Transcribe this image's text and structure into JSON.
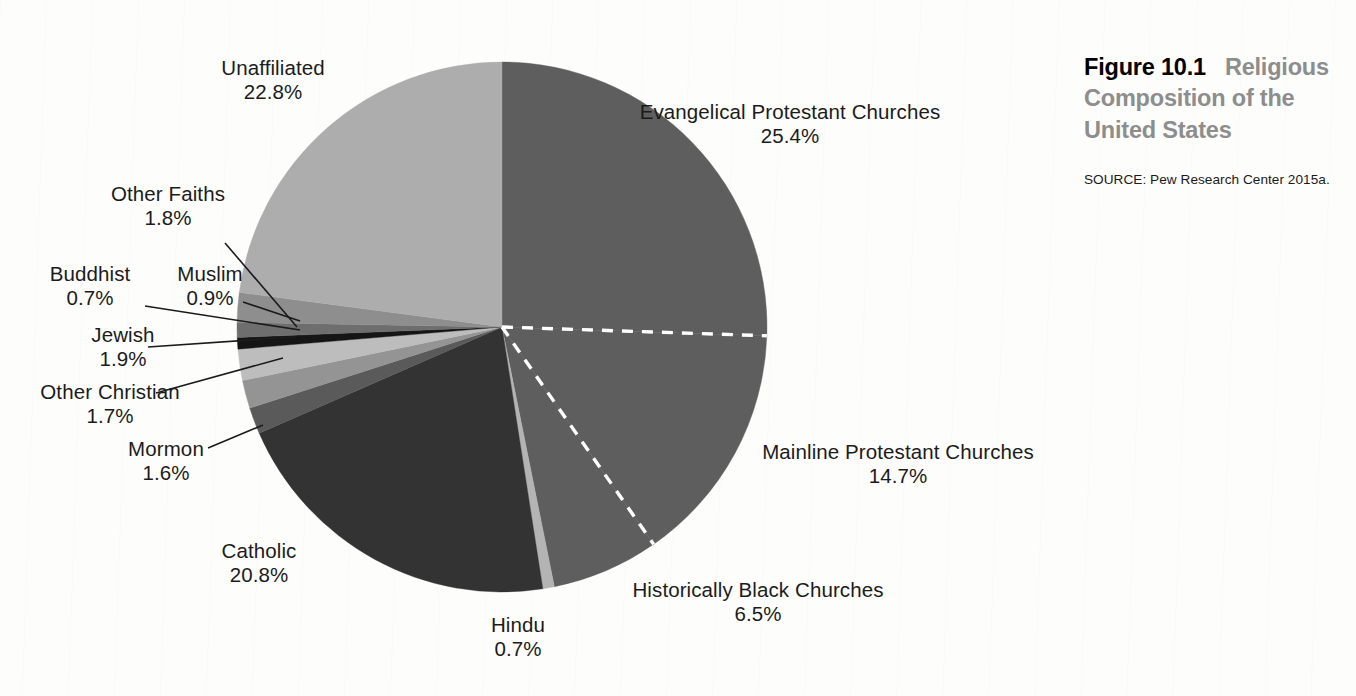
{
  "figure": {
    "number": "Figure 10.1",
    "name": "Religious Composition of the United States",
    "source": "SOURCE: Pew Research Center 2015a."
  },
  "chart_data": {
    "type": "pie",
    "title": "Religious Composition of the United States",
    "source": "SOURCE: Pew Research Center 2015a.",
    "unit": "percent",
    "start_angle_deg": 0,
    "direction": "clockwise",
    "legend": "none-labels-outside",
    "categories": [
      "Evangelical Protestant Churches",
      "Mainline Protestant Churches",
      "Historically Black Churches",
      "Hindu",
      "Catholic",
      "Mormon",
      "Other Christian",
      "Jewish",
      "Buddhist",
      "Muslim",
      "Other Faiths",
      "Unaffiliated"
    ],
    "values": [
      25.4,
      14.7,
      6.5,
      0.7,
      20.8,
      1.6,
      1.7,
      1.9,
      0.7,
      0.9,
      1.8,
      22.8
    ],
    "labels": [
      "25.4%",
      "14.7%",
      "6.5%",
      "0.7%",
      "20.8%",
      "1.6%",
      "1.7%",
      "1.9%",
      "0.7%",
      "0.9%",
      "1.8%",
      "22.8%"
    ],
    "colors": [
      "#5e5e5e",
      "#5e5e5e",
      "#5e5e5e",
      "#b4b4b4",
      "#333333",
      "#5a5a5a",
      "#949494",
      "#bdbdbd",
      "#151515",
      "#6e6e6e",
      "#8e8e8e",
      "#adadad"
    ],
    "dashed_separators_between": [
      "Evangelical Protestant Churches|Mainline Protestant Churches",
      "Mainline Protestant Churches|Historically Black Churches"
    ]
  },
  "slice_labels": [
    {
      "name": "Unaffiliated",
      "pct": "22.8%"
    },
    {
      "name": "Other Faiths",
      "pct": "1.8%"
    },
    {
      "name": "Buddhist",
      "pct": "0.7%"
    },
    {
      "name": "Muslim",
      "pct": "0.9%"
    },
    {
      "name": "Jewish",
      "pct": "1.9%"
    },
    {
      "name": "Other Christian",
      "pct": "1.7%"
    },
    {
      "name": "Mormon",
      "pct": "1.6%"
    },
    {
      "name": "Catholic",
      "pct": "20.8%"
    },
    {
      "name": "Hindu",
      "pct": "0.7%"
    },
    {
      "name": "Historically Black Churches",
      "pct": "6.5%"
    },
    {
      "name": "Mainline Protestant Churches",
      "pct": "14.7%"
    },
    {
      "name": "Evangelical Protestant Churches",
      "pct": "25.4%"
    }
  ]
}
